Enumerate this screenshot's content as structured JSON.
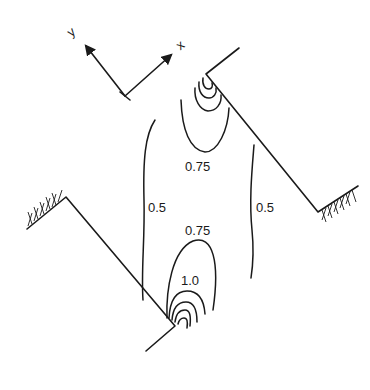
{
  "diagram": {
    "type": "contour-plot-in-channel-bend",
    "axes": {
      "x_label": "x",
      "y_label": "y"
    },
    "contour_labels": [
      {
        "id": "upper_075",
        "text": "0.75"
      },
      {
        "id": "left_05",
        "text": "0.5"
      },
      {
        "id": "right_05",
        "text": "0.5"
      },
      {
        "id": "lower_075",
        "text": "0.75"
      },
      {
        "id": "lower_10",
        "text": "1.0"
      }
    ],
    "contour_levels": [
      0.5,
      0.75,
      1.0
    ],
    "colors": {
      "ink": "#1a1a1a",
      "background": "#ffffff"
    }
  }
}
